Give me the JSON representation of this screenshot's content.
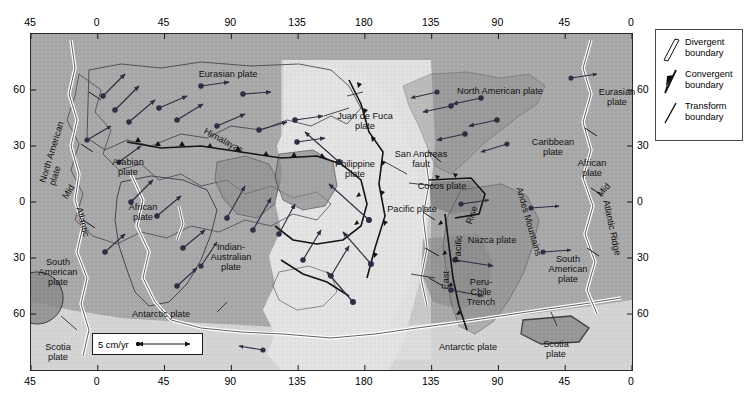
{
  "axes": {
    "top": [
      "45",
      "0",
      "45",
      "90",
      "135",
      "180",
      "135",
      "90",
      "45",
      "0"
    ],
    "bottom": [
      "45",
      "0",
      "45",
      "90",
      "135",
      "180",
      "135",
      "90",
      "45",
      "0"
    ],
    "left": [
      "60",
      "30",
      "0",
      "30",
      "60"
    ],
    "right": [
      "60",
      "30",
      "0",
      "30",
      "60"
    ]
  },
  "scale": {
    "label": "5 cm/yr"
  },
  "legend": {
    "items": [
      {
        "name": "divergent",
        "label": "Divergent\nboundary"
      },
      {
        "name": "convergent",
        "label": "Convergent\nboundary"
      },
      {
        "name": "transform",
        "label": "Transform\nboundary"
      }
    ]
  },
  "map_labels": {
    "north_american_left": "North American\nplate",
    "eurasian": "Eurasian plate",
    "north_american_right": "North American plate",
    "eurasian_right": "Eurasian\nplate",
    "caribbean": "Caribbean\nplate",
    "african_right": "African\nplate",
    "arabian": "Arabian\nplate",
    "african": "African\nplate",
    "indian_australian": "Indian-\nAustralian\nplate",
    "philippine": "Philippine\nplate",
    "juan_de_fuca": "Juan de Fuca\nplate",
    "san_andreas": "San Andreas\nfault",
    "cocos": "Cocos plate",
    "pacific": "Pacific plate",
    "nazca": "Nazca plate",
    "south_american_right": "South\nAmerican\nplate",
    "south_american_left": "South\nAmerican\nplate",
    "peru_chile": "Peru-\nChile\nTrench",
    "antarctic_left": "Antarctic plate",
    "antarctic_right": "Antarctic plate",
    "scotia_left": "Scotia\nplate",
    "scotia_right": "Scotia\nplate",
    "himalayas": "Himalayas",
    "mid_atlantic_left": "Mid",
    "atlantic_left": "Atlantic",
    "mid_atlantic_right": "Mid",
    "atlantic_ridge_right": "Atlantic Ridge",
    "east": "East",
    "pacific_rot": "Pacific",
    "rise": "Rise",
    "andes": "Andes Mountains"
  },
  "colors": {
    "ocean_light": "#e3e3e3",
    "continent_mid": "#9b9b9b",
    "continent_dark": "#7d7d7d",
    "plate_base": "#bdbdbd",
    "boundary": "#1a1a1a",
    "frame": "#2a2a2a",
    "background": "#ffffff"
  }
}
